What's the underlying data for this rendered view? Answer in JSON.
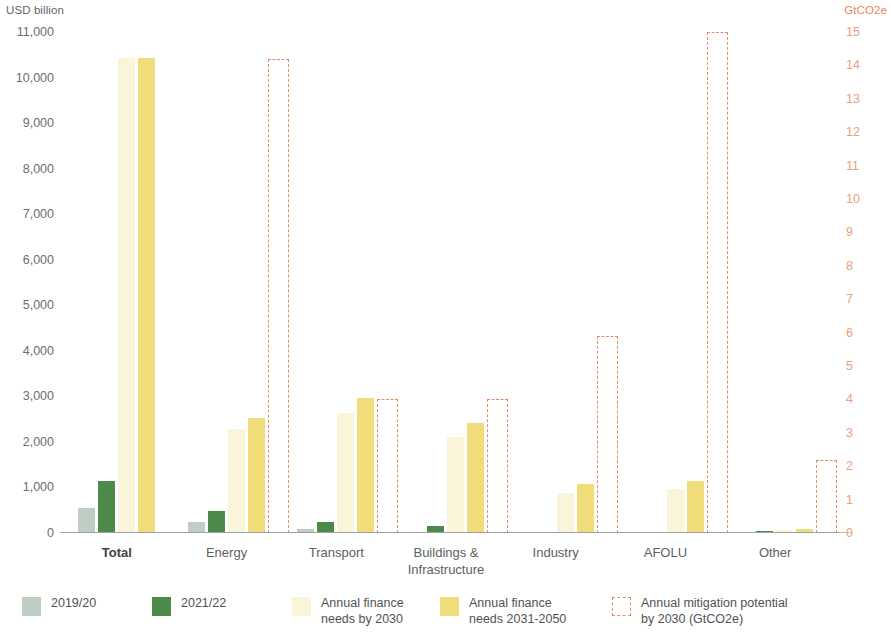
{
  "axes": {
    "left_title": "USD billion",
    "right_title": "GtCO2e",
    "left_ticks": [
      "11,000",
      "10,000",
      "9,000",
      "8,000",
      "7,000",
      "6,000",
      "5,000",
      "4,000",
      "3,000",
      "2,000",
      "1,000",
      "0"
    ],
    "right_ticks": [
      "15",
      "14",
      "13",
      "12",
      "11",
      "10",
      "9",
      "8",
      "7",
      "6",
      "5",
      "4",
      "3",
      "2",
      "1",
      "0"
    ]
  },
  "legend": {
    "items": [
      {
        "key": "2019_20",
        "label": "2019/20",
        "color": "#bfcdc2",
        "style": "solid"
      },
      {
        "key": "2021_22",
        "label": "2021/22",
        "color": "#4d8a4a",
        "style": "solid"
      },
      {
        "key": "needs_2030",
        "label": "Annual finance\nneeds by 2030",
        "color": "#faf4d9",
        "style": "solid"
      },
      {
        "key": "needs_2031_2050",
        "label": "Annual finance\nneeds 2031-2050",
        "color": "#f0dc78",
        "style": "solid"
      },
      {
        "key": "mitigation_2030",
        "label": "Annual mitigation potential\nby 2030 (GtCO2e)",
        "color": "#e8896a",
        "style": "dashed"
      }
    ]
  },
  "chart_data": {
    "type": "bar",
    "title": "",
    "xlabel": "",
    "ylabel": "USD billion",
    "y2label": "GtCO2e",
    "ylim": [
      0,
      11000
    ],
    "y2lim": [
      0,
      15
    ],
    "grid": false,
    "legend_position": "bottom",
    "categories": [
      "Total",
      "Energy",
      "Transport",
      "Buildings &\nInfrastructure",
      "Industry",
      "AFOLU",
      "Other"
    ],
    "series": [
      {
        "name": "2019/20",
        "axis": "left",
        "unit": "USD billion",
        "values": [
          560,
          240,
          90,
          20,
          10,
          5,
          0
        ]
      },
      {
        "name": "2021/22",
        "axis": "left",
        "unit": "USD billion",
        "values": [
          1140,
          490,
          250,
          150,
          20,
          15,
          40
        ]
      },
      {
        "name": "Annual finance needs by 2030",
        "axis": "left",
        "unit": "USD billion",
        "values": [
          10420,
          2280,
          2640,
          2100,
          880,
          960,
          70
        ]
      },
      {
        "name": "Annual finance needs 2031-2050",
        "axis": "left",
        "unit": "USD billion",
        "values": [
          10420,
          2520,
          2960,
          2410,
          1070,
          1150,
          80
        ]
      },
      {
        "name": "Annual mitigation potential by 2030 (GtCO2e)",
        "axis": "right",
        "unit": "GtCO2e",
        "values": [
          null,
          14.2,
          4.0,
          4.0,
          5.9,
          15.0,
          2.2
        ]
      }
    ]
  }
}
